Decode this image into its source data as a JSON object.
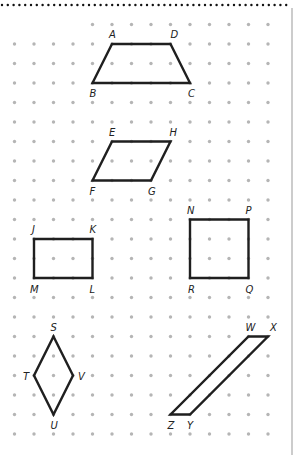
{
  "diagram": {
    "grid": {
      "origin_x": 14.5,
      "origin_y": 24.5,
      "step": 19.5,
      "cols": 14,
      "rows": 22,
      "top_row_start_col": 4,
      "dot_color": "#b5b5b5",
      "dot_radius": 1.7
    },
    "top_border": {
      "style": "dotted",
      "color": "#111111",
      "y": 5
    },
    "right_border": {
      "color": "#999999",
      "x": 292
    },
    "stroke_color": "#1f1f1f",
    "shapes": [
      {
        "id": "ABCD",
        "name": "trapezoid",
        "vertices": [
          {
            "label": "A",
            "col": 5,
            "row": 1,
            "lx": -3,
            "ly": -6
          },
          {
            "label": "D",
            "col": 8,
            "row": 1,
            "lx": 0,
            "ly": -6
          },
          {
            "label": "C",
            "col": 9,
            "row": 3,
            "lx": -2,
            "ly": 14
          },
          {
            "label": "B",
            "col": 4,
            "row": 3,
            "lx": -3,
            "ly": 14
          }
        ]
      },
      {
        "id": "EHGF",
        "name": "parallelogram-efgh",
        "vertices": [
          {
            "label": "E",
            "col": 5,
            "row": 6,
            "lx": -3,
            "ly": -6
          },
          {
            "label": "H",
            "col": 8,
            "row": 6,
            "lx": -1,
            "ly": -6
          },
          {
            "label": "G",
            "col": 7,
            "row": 8,
            "lx": -3,
            "ly": 14
          },
          {
            "label": "F",
            "col": 4,
            "row": 8,
            "lx": -3,
            "ly": 14
          }
        ]
      },
      {
        "id": "JKLM",
        "name": "rectangle",
        "vertices": [
          {
            "label": "J",
            "col": 1,
            "row": 11,
            "lx": -2,
            "ly": -6
          },
          {
            "label": "K",
            "col": 4,
            "row": 11,
            "lx": -3,
            "ly": -6
          },
          {
            "label": "L",
            "col": 4,
            "row": 13,
            "lx": -3,
            "ly": 15
          },
          {
            "label": "M",
            "col": 1,
            "row": 13,
            "lx": -4,
            "ly": 15
          }
        ]
      },
      {
        "id": "NPQR",
        "name": "square",
        "vertices": [
          {
            "label": "N",
            "col": 9,
            "row": 10,
            "lx": -3,
            "ly": -6
          },
          {
            "label": "P",
            "col": 12,
            "row": 10,
            "lx": -3,
            "ly": -6
          },
          {
            "label": "Q",
            "col": 12,
            "row": 13,
            "lx": -3,
            "ly": 15
          },
          {
            "label": "R",
            "col": 9,
            "row": 13,
            "lx": -2,
            "ly": 15
          }
        ]
      },
      {
        "id": "SVUT",
        "name": "rhombus",
        "vertices": [
          {
            "label": "S",
            "col": 2,
            "row": 16,
            "lx": -3,
            "ly": -6
          },
          {
            "label": "V",
            "col": 3,
            "row": 18,
            "lx": 5,
            "ly": 4
          },
          {
            "label": "U",
            "col": 2,
            "row": 20,
            "lx": -3,
            "ly": 14
          },
          {
            "label": "T",
            "col": 1,
            "row": 18,
            "lx": -11,
            "ly": 4
          }
        ]
      },
      {
        "id": "WXYZ",
        "name": "parallelogram-wxyz",
        "vertices": [
          {
            "label": "W",
            "col": 12,
            "row": 16,
            "lx": -3,
            "ly": -6
          },
          {
            "label": "X",
            "col": 13,
            "row": 16,
            "lx": 2,
            "ly": -6
          },
          {
            "label": "Y",
            "col": 9,
            "row": 20,
            "lx": -3,
            "ly": 14
          },
          {
            "label": "Z",
            "col": 8,
            "row": 20,
            "lx": -3,
            "ly": 14
          }
        ]
      }
    ]
  }
}
